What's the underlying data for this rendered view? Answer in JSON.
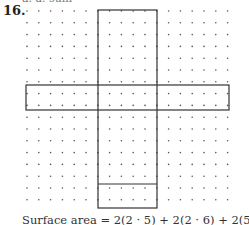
{
  "problem": {
    "number": "16.",
    "top_fragment": "a. a. sum",
    "caption": "Surface area = 2(2 · 5) + 2(2 · 6) + 2(5 · 6)"
  },
  "grid": {
    "dot_color": "#555555",
    "line_color": "#333333",
    "origin_x": 27,
    "origin_y": 11,
    "spacing": 11.8,
    "cols": 18,
    "rows": 17
  },
  "net": {
    "description": "Cross-shaped net of rectangular prism 2 x 5 x 6",
    "vertical_strip": {
      "x1": 98,
      "x2": 157,
      "y1": 10,
      "y2": 208
    },
    "horizontal_band": {
      "x1": 26,
      "x2": 229,
      "y1": 85,
      "y2": 110
    },
    "bottom_divider_y": 184
  }
}
